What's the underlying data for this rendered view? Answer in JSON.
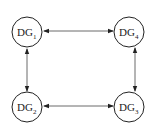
{
  "diagram": {
    "nodes": [
      {
        "id": "DG1",
        "label": "DG",
        "subscript": "1",
        "cx": 27,
        "cy": 32
      },
      {
        "id": "DG4",
        "label": "DG",
        "subscript": "4",
        "cx": 129,
        "cy": 32
      },
      {
        "id": "DG2",
        "label": "DG",
        "subscript": "2",
        "cx": 27,
        "cy": 107
      },
      {
        "id": "DG3",
        "label": "DG",
        "subscript": "3",
        "cx": 129,
        "cy": 107
      }
    ],
    "edges": [
      {
        "from": "DG1",
        "to": "DG4",
        "type": "bidirectional"
      },
      {
        "from": "DG1",
        "to": "DG2",
        "type": "bidirectional"
      },
      {
        "from": "DG4",
        "to": "DG3",
        "type": "bidirectional"
      },
      {
        "from": "DG2",
        "to": "DG3",
        "type": "bidirectional"
      }
    ]
  }
}
